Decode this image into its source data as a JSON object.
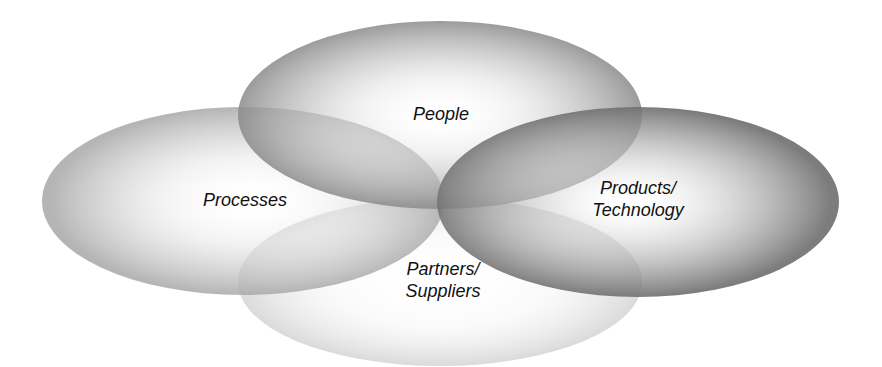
{
  "diagram": {
    "type": "overlapping-ellipses",
    "circles": [
      {
        "id": "people",
        "label_lines": [
          "People"
        ],
        "cx": 440,
        "cy": 115,
        "rx": 202,
        "ry": 94,
        "edge_color": "#7a7a7a",
        "opacity": 0.62
      },
      {
        "id": "processes",
        "label_lines": [
          "Processes"
        ],
        "cx": 243,
        "cy": 201,
        "rx": 201,
        "ry": 94,
        "edge_color": "#a0a0a0",
        "opacity": 0.5
      },
      {
        "id": "products",
        "label_lines": [
          "Products/",
          "Technology"
        ],
        "cx": 638,
        "cy": 202,
        "rx": 201,
        "ry": 95,
        "edge_color": "#6a6a6a",
        "opacity": 0.66
      },
      {
        "id": "partners",
        "label_lines": [
          "Partners/",
          "Suppliers"
        ],
        "cx": 440,
        "cy": 282,
        "rx": 202,
        "ry": 84,
        "edge_color": "#d8d8d8",
        "opacity": 0.45
      }
    ]
  },
  "labels": {
    "people": "People",
    "processes": "Processes",
    "products_1": "Products/",
    "products_2": "Technology",
    "partners_1": "Partners/",
    "partners_2": "Suppliers"
  }
}
